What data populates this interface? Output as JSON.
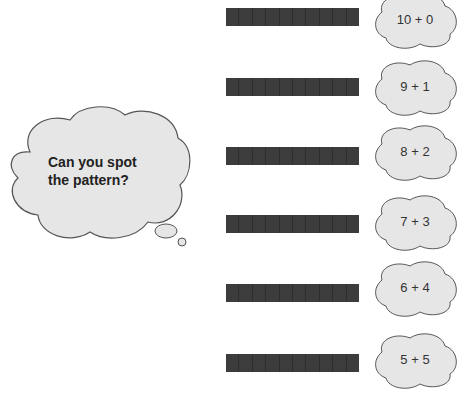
{
  "thought_bubble": {
    "line1": "Can you spot",
    "line2": "the pattern?"
  },
  "rows": [
    {
      "label": "10 + 0",
      "segments": 10
    },
    {
      "label": "9 + 1",
      "segments": 10
    },
    {
      "label": "8 + 2",
      "segments": 10
    },
    {
      "label": "7 + 3",
      "segments": 10
    },
    {
      "label": "6 + 4",
      "segments": 10
    },
    {
      "label": "5 + 5",
      "segments": 10
    }
  ],
  "colors": {
    "bar": "#3c3c3c",
    "cloud_fill": "#e6e6e6",
    "cloud_stroke": "#555555"
  }
}
